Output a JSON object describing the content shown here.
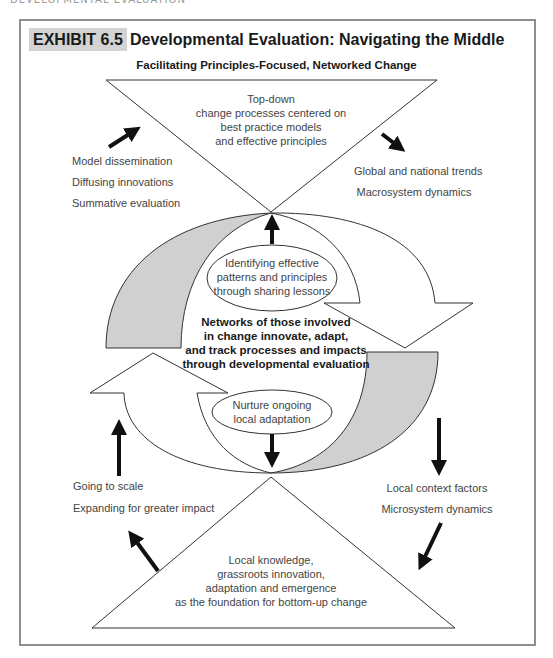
{
  "page_header": "DEVELOPMENTAL EVALUATION",
  "exhibit": {
    "label": "EXHIBIT 6.5",
    "title": "Developmental Evaluation: Navigating the Middle",
    "subtitle": "Facilitating Principles-Focused, Networked Change"
  },
  "top_triangle": {
    "lines": [
      "Top-down",
      "change processes centered on",
      "best practice models",
      "and effective principles"
    ]
  },
  "bottom_triangle": {
    "lines": [
      "Local knowledge,",
      "grassroots innovation,",
      "adaptation and emergence",
      "as the foundation for bottom-up change"
    ]
  },
  "upper_left_labels": [
    "Model dissemination",
    "Diffusing innovations",
    "Summative evaluation"
  ],
  "upper_right_labels": [
    "Global and national trends",
    "Macrosystem dynamics"
  ],
  "lower_left_labels": [
    "Going to scale",
    "Expanding for greater impact"
  ],
  "lower_right_labels": [
    "Local context factors",
    "Microsystem dynamics"
  ],
  "upper_ellipse": {
    "lines": [
      "Identifying effective",
      "patterns and principles",
      "through sharing lessons"
    ]
  },
  "lower_ellipse": {
    "lines": [
      "Nurture ongoing",
      "local adaptation"
    ]
  },
  "center_text": {
    "lines": [
      "Networks of those involved",
      "in change innovate, adapt,",
      "and track processes and impacts",
      "through developmental evaluation"
    ]
  },
  "colors": {
    "frame": "#8f8f8f",
    "label_bg": "#d3d3d3",
    "gray_band": "#d0d0d0",
    "arrow": "#111111",
    "stroke": "#333333"
  }
}
